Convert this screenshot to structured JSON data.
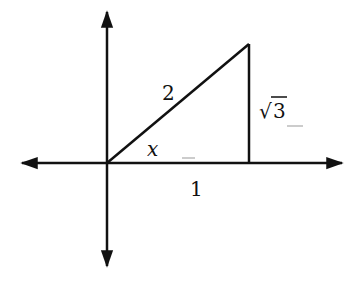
{
  "diagram": {
    "labels": {
      "hypotenuse": "2",
      "opposite": "3",
      "opposite_prefix": "√",
      "adjacent": "1",
      "angle": "x"
    },
    "colors": {
      "stroke": "#111111",
      "background": "#ffffff"
    }
  }
}
